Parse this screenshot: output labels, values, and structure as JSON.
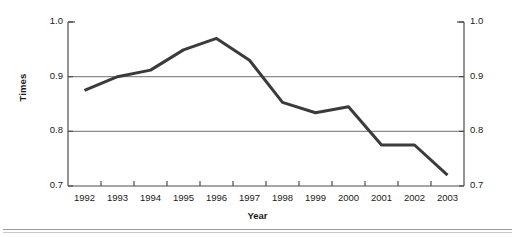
{
  "chart_data": {
    "type": "line",
    "title": "",
    "xlabel": "Year",
    "ylabel": "Times",
    "categories": [
      "1992",
      "1993",
      "1994",
      "1995",
      "1996",
      "1997",
      "1998",
      "1999",
      "2000",
      "2001",
      "2002",
      "2003"
    ],
    "values": [
      0.875,
      0.9,
      0.912,
      0.949,
      0.97,
      0.93,
      0.853,
      0.834,
      0.845,
      0.775,
      0.775,
      0.72
    ],
    "series": [
      {
        "name": "Times",
        "values": [
          0.875,
          0.9,
          0.912,
          0.949,
          0.97,
          0.93,
          0.853,
          0.834,
          0.845,
          0.775,
          0.775,
          0.72
        ],
        "color": "#3b3b3b"
      }
    ],
    "ylim": [
      0.7,
      1.0
    ],
    "yticks": [
      "0.7",
      "0.8",
      "0.9",
      "1.0"
    ],
    "ytick_values": [
      0.7,
      0.8,
      0.9,
      1.0
    ],
    "y_axis_left_labels": [
      "1.0",
      "0.9",
      "0.8",
      "0.7"
    ],
    "y_axis_right_labels": [
      "1.0",
      "0.9",
      "0.8",
      "0.7"
    ],
    "gridlines": [
      "0.9",
      "0.8"
    ],
    "grid": true,
    "grid_color": "#8c8c8c",
    "legend": "none",
    "legend_position": "none",
    "axis_color": "#4d4d4d",
    "line_color": "#3b3b3b",
    "line_width": 3
  },
  "axes": {
    "y_title": "Times",
    "x_title": "Year"
  }
}
